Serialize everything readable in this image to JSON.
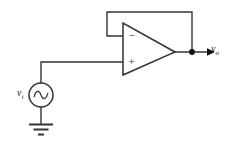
{
  "figure": {
    "name": "op-amp-voltage-follower",
    "background_color": "#ffffff",
    "line_color": "#333333",
    "width": 234,
    "height": 152
  },
  "labels": {
    "output_voltage": "v",
    "output_voltage_sub": "o",
    "input_voltage": "v",
    "input_voltage_sub": "i"
  },
  "opamp": {
    "name": "operational-amplifier",
    "inverting_input_symbol": "−",
    "noninverting_input_symbol": "+",
    "body_fill": "#ffffff"
  },
  "source": {
    "name": "ac-voltage-source",
    "symbol": "sine-wave"
  },
  "ground": {
    "name": "ground-symbol",
    "bars": 3
  },
  "nodes": {
    "output_node_label": "output-junction"
  }
}
